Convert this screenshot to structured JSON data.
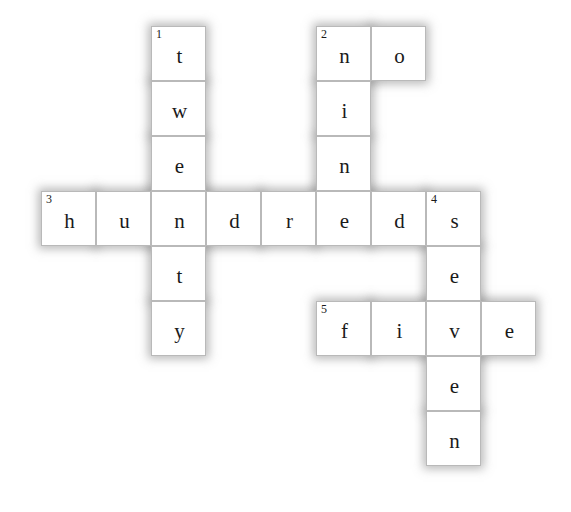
{
  "puzzle": {
    "title": "Number words crossword",
    "geometry": {
      "cell_size": 55,
      "origin_x": 41,
      "origin_y": 26,
      "columns": 9,
      "rows": 8
    },
    "cells": [
      {
        "name": "cell-r0c2",
        "col": 2,
        "row": 0,
        "letter": "t",
        "number": "1"
      },
      {
        "name": "cell-r1c2",
        "col": 2,
        "row": 1,
        "letter": "w",
        "number": ""
      },
      {
        "name": "cell-r2c2",
        "col": 2,
        "row": 2,
        "letter": "e",
        "number": ""
      },
      {
        "name": "cell-r0c5",
        "col": 5,
        "row": 0,
        "letter": "n",
        "number": "2"
      },
      {
        "name": "cell-r0c6",
        "col": 6,
        "row": 0,
        "letter": "o",
        "number": ""
      },
      {
        "name": "cell-r1c5",
        "col": 5,
        "row": 1,
        "letter": "i",
        "number": ""
      },
      {
        "name": "cell-r2c5",
        "col": 5,
        "row": 2,
        "letter": "n",
        "number": ""
      },
      {
        "name": "cell-r3c0",
        "col": 0,
        "row": 3,
        "letter": "h",
        "number": "3"
      },
      {
        "name": "cell-r3c1",
        "col": 1,
        "row": 3,
        "letter": "u",
        "number": ""
      },
      {
        "name": "cell-r3c2",
        "col": 2,
        "row": 3,
        "letter": "n",
        "number": ""
      },
      {
        "name": "cell-r3c3",
        "col": 3,
        "row": 3,
        "letter": "d",
        "number": ""
      },
      {
        "name": "cell-r3c4",
        "col": 4,
        "row": 3,
        "letter": "r",
        "number": ""
      },
      {
        "name": "cell-r3c5",
        "col": 5,
        "row": 3,
        "letter": "e",
        "number": ""
      },
      {
        "name": "cell-r3c6",
        "col": 6,
        "row": 3,
        "letter": "d",
        "number": ""
      },
      {
        "name": "cell-r3c7",
        "col": 7,
        "row": 3,
        "letter": "s",
        "number": "4"
      },
      {
        "name": "cell-r4c2",
        "col": 2,
        "row": 4,
        "letter": "t",
        "number": ""
      },
      {
        "name": "cell-r5c2",
        "col": 2,
        "row": 5,
        "letter": "y",
        "number": ""
      },
      {
        "name": "cell-r4c7",
        "col": 7,
        "row": 4,
        "letter": "e",
        "number": ""
      },
      {
        "name": "cell-r5c5",
        "col": 5,
        "row": 5,
        "letter": "f",
        "number": "5"
      },
      {
        "name": "cell-r5c6",
        "col": 6,
        "row": 5,
        "letter": "i",
        "number": ""
      },
      {
        "name": "cell-r5c7",
        "col": 7,
        "row": 5,
        "letter": "v",
        "number": ""
      },
      {
        "name": "cell-r5c8",
        "col": 8,
        "row": 5,
        "letter": "e",
        "number": ""
      },
      {
        "name": "cell-r6c7",
        "col": 7,
        "row": 6,
        "letter": "e",
        "number": ""
      },
      {
        "name": "cell-r7c7",
        "col": 7,
        "row": 7,
        "letter": "n",
        "number": ""
      }
    ],
    "entries": {
      "across": [
        {
          "number": "2",
          "answer": "no"
        },
        {
          "number": "3",
          "answer": "hundreds"
        },
        {
          "number": "5",
          "answer": "five"
        }
      ],
      "down": [
        {
          "number": "1",
          "answer": "twenty"
        },
        {
          "number": "2",
          "answer": "nine"
        },
        {
          "number": "4",
          "answer": "seven"
        }
      ]
    },
    "colors": {
      "cell_fill": "#ffffff",
      "cell_border": "#b9b9b9",
      "text": "#1a1a1a",
      "halo": "rgba(120,120,120,0.50)",
      "page_background": "#ffffff"
    }
  }
}
